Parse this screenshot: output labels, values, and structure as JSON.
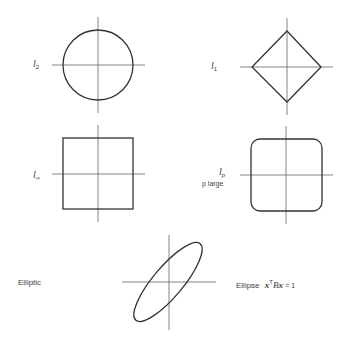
{
  "panels": [
    {
      "id": "l2",
      "label": "l",
      "subscript": "2",
      "shape": "circle"
    },
    {
      "id": "l1",
      "label": "l",
      "subscript": "1",
      "shape": "diamond"
    },
    {
      "id": "linf",
      "label": "l",
      "subscript": "∞",
      "shape": "square"
    },
    {
      "id": "lp",
      "label": "l",
      "subscript": "p",
      "sublabel": "p large",
      "shape": "rounded-square"
    },
    {
      "id": "elliptic",
      "label": "Elliptic",
      "shape": "ellipse",
      "caption": {
        "prefix": "Ellipse",
        "x1": "x",
        "sup": "T",
        "B": "B",
        "x2": "x",
        "rhs": "= 1"
      }
    }
  ],
  "colors": {
    "stroke": "#333333",
    "axis": "#666666",
    "background": "#ffffff"
  }
}
